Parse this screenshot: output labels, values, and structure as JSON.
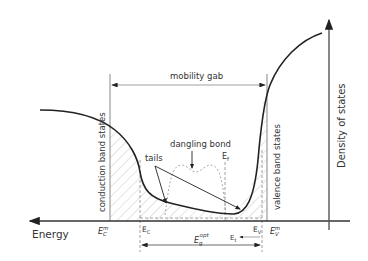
{
  "diagram": {
    "title": "",
    "labels": {
      "mobility_gap": "mobility gab",
      "density_of_states": "Density of states",
      "energy": "Energy",
      "conduction_band_states": "conduction band states",
      "valence_band_states": "valence band states",
      "tails": "tails",
      "dangling_bond": "dangling bond",
      "ef": "E",
      "ef_sub": "f",
      "ec_m": "E",
      "ec_m_sub": "C",
      "ec_m_sup": "m",
      "ec": "E",
      "ec_sub": "C",
      "ev": "E",
      "ev_sub": "V",
      "ev_m": "E",
      "ev_m_sub": "V",
      "ev_m_sup": "m",
      "eg_opt": "E",
      "eg_opt_sub": "g",
      "eg_opt_sup": "opt",
      "et": "E",
      "et_sub": "t"
    },
    "colors": {
      "curve": "#222222",
      "axis": "#555555",
      "hatch": "#bbbbbb",
      "dashed": "#888888",
      "text": "#333333"
    }
  }
}
